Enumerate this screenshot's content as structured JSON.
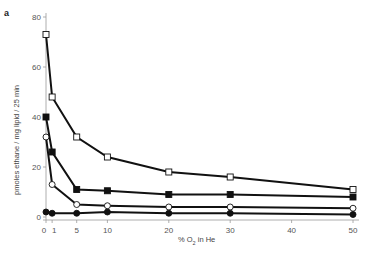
{
  "chart_data": {
    "type": "line",
    "panel_label": "a",
    "title": "",
    "xlabel": "% O2 in He",
    "xlabel_main": "% O",
    "xlabel_sub": "2",
    "xlabel_rest": " in He",
    "ylabel": "pmoles ethane / mg lipid / 25 min",
    "xlim": [
      0,
      50
    ],
    "ylim": [
      0,
      80
    ],
    "x_ticks": [
      0,
      1,
      5,
      10,
      20,
      30,
      40,
      50
    ],
    "x_tick_labels": [
      "0",
      "1",
      "5",
      "10",
      "20",
      "30",
      "40",
      "50"
    ],
    "y_ticks": [
      0,
      20,
      40,
      60,
      80
    ],
    "y_tick_labels": [
      "0",
      "20",
      "40",
      "60",
      "80"
    ],
    "grid": false,
    "legend": null,
    "x": [
      0,
      1,
      5,
      10,
      20,
      30,
      50
    ],
    "series": [
      {
        "name": "open-square",
        "marker": "square-open",
        "values": [
          73,
          48,
          32,
          24,
          18,
          16,
          11
        ]
      },
      {
        "name": "filled-square",
        "marker": "square-filled",
        "values": [
          40,
          26,
          11,
          10.5,
          9,
          9,
          8
        ]
      },
      {
        "name": "open-circle",
        "marker": "circle-open",
        "values": [
          32,
          13,
          5,
          4.5,
          4,
          4,
          3.5
        ]
      },
      {
        "name": "filled-circle",
        "marker": "circle-filled",
        "values": [
          2,
          1.5,
          1.5,
          2,
          1.5,
          1.5,
          1
        ]
      }
    ]
  }
}
